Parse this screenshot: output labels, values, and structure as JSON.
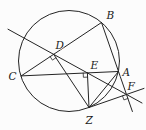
{
  "figure": {
    "width": 146,
    "height": 130,
    "background": "#fcfcfc",
    "stroke_color": "#242424",
    "stroke_width": 1,
    "label_color": "#1a1a1a",
    "label_font_size": 10.5
  },
  "circle": {
    "cx": 69,
    "cy": 61,
    "r": 50.5
  },
  "points": {
    "A": {
      "label": "A",
      "x": 118.5,
      "y": 71.5,
      "label_x": 122.5,
      "label_y": 75.5
    },
    "B": {
      "label": "B",
      "x": 101.5,
      "y": 22.5,
      "label_x": 106.5,
      "label_y": 19
    },
    "C": {
      "label": "C",
      "x": 21.2,
      "y": 75.9,
      "label_x": 8.5,
      "label_y": 80
    },
    "D": {
      "label": "D",
      "x": 53.6,
      "y": 54.3,
      "label_x": 55.5,
      "label_y": 49
    },
    "E": {
      "label": "E",
      "x": 87.4,
      "y": 72.9,
      "label_x": 90.5,
      "label_y": 68.5
    },
    "F": {
      "label": "F",
      "x": 126.5,
      "y": 94.5,
      "label_x": 127.5,
      "label_y": 90
    },
    "Z": {
      "label": "Z",
      "x": 89,
      "y": 107.5,
      "label_x": 85.5,
      "label_y": 124
    }
  },
  "segments": [
    {
      "name": "chord-CB",
      "x1": 21.2,
      "y1": 75.9,
      "x2": 101.5,
      "y2": 22.5
    },
    {
      "name": "chord-CA",
      "x1": 21.2,
      "y1": 75.9,
      "x2": 118.5,
      "y2": 71.5
    },
    {
      "name": "line-B-A-F-extended",
      "x1": 101.5,
      "y1": 22.5,
      "x2": 132.4,
      "y2": 111.5
    },
    {
      "name": "simson-line-DEF",
      "x1": 8,
      "y1": 29.2,
      "x2": 142,
      "y2": 103
    },
    {
      "name": "segment-ZD",
      "x1": 89,
      "y1": 107.5,
      "x2": 53.6,
      "y2": 54.3
    },
    {
      "name": "segment-ZE",
      "x1": 89,
      "y1": 107.5,
      "x2": 87.4,
      "y2": 72.9
    },
    {
      "name": "segment-ZA",
      "x1": 89,
      "y1": 107.5,
      "x2": 118.5,
      "y2": 71.5
    },
    {
      "name": "line-Z-F-extended",
      "x1": 89,
      "y1": 107.5,
      "x2": 144,
      "y2": 88.4
    }
  ],
  "right_angle_marks": [
    {
      "name": "right-angle-at-D",
      "points": "50.1,56.6 52.4,60.1 55.9,57.8"
    },
    {
      "name": "right-angle-at-E",
      "points": "83.2,73.1 83.4,77.3 87.6,77.1"
    },
    {
      "name": "right-angle-at-F",
      "points": "122.5,95.9 123.9,99.9 127.9,98.5"
    }
  ]
}
